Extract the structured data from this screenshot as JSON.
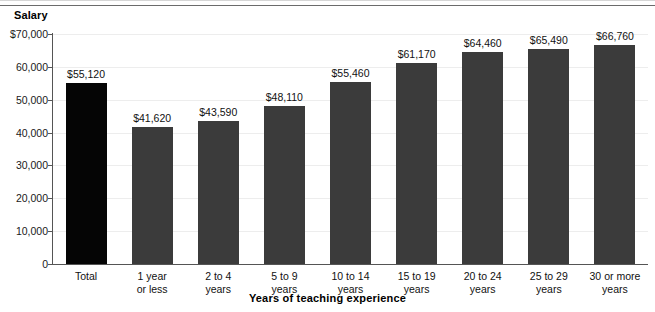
{
  "chart_data": {
    "type": "bar",
    "title": "",
    "ylabel": "Salary",
    "xlabel": "Years of teaching experience",
    "ylim": [
      0,
      70000
    ],
    "grid": true,
    "legend": "none",
    "categories": [
      "Total",
      "1 year\nor less",
      "2 to 4\nyears",
      "5 to 9\nyears",
      "10 to 14\nyears",
      "15 to 19\nyears",
      "20 to 24\nyears",
      "25 to 29\nyears",
      "30 or more\nyears"
    ],
    "values": [
      55120,
      41620,
      43590,
      48110,
      55460,
      61170,
      64460,
      65490,
      66760
    ],
    "data_labels": [
      "$55,120",
      "$41,620",
      "$43,590",
      "$48,110",
      "$55,460",
      "$61,170",
      "$64,460",
      "$65,490",
      "$66,760"
    ],
    "y_ticks": [
      0,
      10000,
      20000,
      30000,
      40000,
      50000,
      60000,
      70000
    ],
    "y_tick_labels": [
      "0",
      "10,000",
      "20,000",
      "30,000",
      "40,000",
      "50,000",
      "60,000",
      "$70,000"
    ],
    "colors": {
      "total_bar": "#050505",
      "category_bar": "#3b3b3b",
      "axis": "#555555",
      "gridline": "#ededed",
      "text": "#111111"
    }
  }
}
